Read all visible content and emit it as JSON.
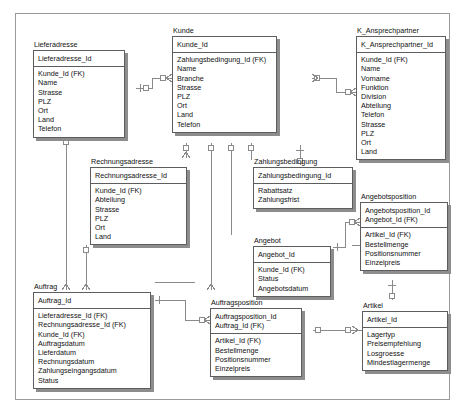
{
  "diagram": {
    "notation": "crows-foot",
    "frame_visible": true,
    "colors": {
      "background": "#ffffff",
      "box_border": "#5d5d5d",
      "box_shadow": "#8d8d8d",
      "frame_border": "#9a9a9a",
      "text": "#111111",
      "connector": "#8a8a8a"
    }
  },
  "entities": [
    {
      "name": "Lieferadresse",
      "keys": [
        "Lieferadresse_Id"
      ],
      "attributes": [
        "Kunde_Id (FK)",
        "Name",
        "Strasse",
        "PLZ",
        "Ort",
        "Land",
        "Telefon"
      ]
    },
    {
      "name": "Kunde",
      "keys": [
        "Kunde_Id"
      ],
      "attributes": [
        "Zahlungsbedingung_Id (FK)",
        "Name",
        "Branche",
        "Strasse",
        "PLZ",
        "Ort",
        "Land",
        "Telefon"
      ]
    },
    {
      "name": "K_Ansprechpartner",
      "keys": [
        "K_Ansprechpartner_Id"
      ],
      "attributes": [
        "Kunde_Id (FK)",
        "Name",
        "Vorname",
        "Funktion",
        "Division",
        "Abteilung",
        "Telefon",
        "Strasse",
        "PLZ",
        "Ort",
        "Land"
      ]
    },
    {
      "name": "Rechnungsadresse",
      "keys": [
        "Rechnungsadresse_Id"
      ],
      "attributes": [
        "Kunde_Id (FK)",
        "Abteilung",
        "Strasse",
        "PLZ",
        "Ort",
        "Land"
      ]
    },
    {
      "name": "Zahlungsbedingung",
      "keys": [
        "Zahlungsbedingung_Id"
      ],
      "attributes": [
        "Rabattsatz",
        "Zahlungsfrist"
      ]
    },
    {
      "name": "Angebotsposition",
      "keys": [
        "Angebotsposition_Id",
        "Angebot_Id (FK)"
      ],
      "attributes": [
        "Artikel_Id (FK)",
        "Bestellmenge",
        "Positionsnummer",
        "Einzelpreis"
      ]
    },
    {
      "name": "Angebot",
      "keys": [
        "Angebot_Id"
      ],
      "attributes": [
        "Kunde_Id (FK)",
        "Status",
        "Angebotsdatum"
      ]
    },
    {
      "name": "Auftrag",
      "keys": [
        "Auftrag_Id"
      ],
      "attributes": [
        "Lieferadresse_Id (FK)",
        "Rechnungsadresse_Id (FK)",
        "Kunde_Id (FK)",
        "Auftragsdatum",
        "Lieferdatum",
        "Rechnungsdatum",
        "Zahlungseingangsdatum",
        "Status"
      ]
    },
    {
      "name": "Auftragsposition",
      "keys": [
        "Auftragsposition_Id",
        "Auftrag_Id (FK)"
      ],
      "attributes": [
        "Artikel_Id (FK)",
        "Bestellmenge",
        "Positionsnummer",
        "Einzelpreis"
      ]
    },
    {
      "name": "Artikel",
      "keys": [
        "Artikel_Id"
      ],
      "attributes": [
        "Lagertyp",
        "Preisempfehlung",
        "Losgroesse",
        "Mindestlagermenge"
      ]
    }
  ],
  "relationships": [
    {
      "from": "Kunde",
      "to": "Lieferadresse",
      "from_card": "one",
      "to_card": "many"
    },
    {
      "from": "Kunde",
      "to": "Rechnungsadresse",
      "from_card": "one",
      "to_card": "many"
    },
    {
      "from": "Kunde",
      "to": "K_Ansprechpartner",
      "from_card": "one",
      "to_card": "many"
    },
    {
      "from": "Kunde",
      "to": "Angebot",
      "from_card": "one",
      "to_card": "many"
    },
    {
      "from": "Kunde",
      "to": "Auftrag",
      "from_card": "one",
      "to_card": "many"
    },
    {
      "from": "Zahlungsbedingung",
      "to": "Kunde",
      "from_card": "one",
      "to_card": "many"
    },
    {
      "from": "Lieferadresse",
      "to": "Auftrag",
      "from_card": "one",
      "to_card": "many"
    },
    {
      "from": "Rechnungsadresse",
      "to": "Auftrag",
      "from_card": "one",
      "to_card": "many"
    },
    {
      "from": "Angebot",
      "to": "Angebotsposition",
      "from_card": "one",
      "to_card": "many"
    },
    {
      "from": "Auftrag",
      "to": "Auftragsposition",
      "from_card": "one",
      "to_card": "many"
    },
    {
      "from": "Artikel",
      "to": "Angebotsposition",
      "from_card": "one",
      "to_card": "many"
    },
    {
      "from": "Artikel",
      "to": "Auftragsposition",
      "from_card": "one",
      "to_card": "many"
    }
  ]
}
